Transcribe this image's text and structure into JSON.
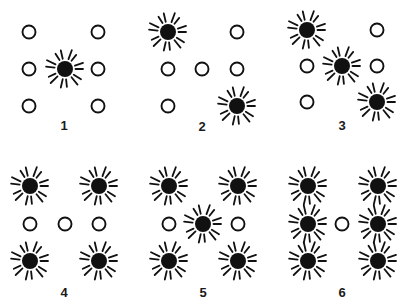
{
  "diagram": {
    "title": "",
    "colors": {
      "ink": "#111111",
      "background": "#ffffff"
    },
    "lamp_positions": [
      "top-left",
      "mid-left",
      "bottom-left",
      "center",
      "top-right",
      "mid-right",
      "bottom-right"
    ],
    "panels": [
      {
        "label": "1",
        "origin": [
          0,
          0
        ],
        "cols": [
          29,
          65,
          98
        ],
        "rows": [
          32,
          69,
          106
        ],
        "label_pos": [
          64,
          125
        ],
        "lit": [
          "center"
        ],
        "unlit": [
          "top-left",
          "mid-left",
          "bottom-left",
          "top-right",
          "mid-right",
          "bottom-right"
        ]
      },
      {
        "label": "2",
        "origin": [
          0,
          0
        ],
        "cols": [
          168,
          202,
          237
        ],
        "rows": [
          32,
          69,
          106
        ],
        "label_pos": [
          202,
          126
        ],
        "lit": [
          "top-left",
          "bottom-right"
        ],
        "unlit": [
          "mid-left",
          "bottom-left",
          "center",
          "top-right",
          "mid-right"
        ]
      },
      {
        "label": "3",
        "origin": [
          0,
          0
        ],
        "cols": [
          307,
          342,
          377
        ],
        "rows": [
          30,
          66,
          102
        ],
        "label_pos": [
          342,
          125
        ],
        "lit": [
          "top-left",
          "center",
          "bottom-right"
        ],
        "unlit": [
          "mid-left",
          "bottom-left",
          "top-right",
          "mid-right"
        ]
      },
      {
        "label": "4",
        "origin": [
          0,
          0
        ],
        "cols": [
          30,
          65,
          99
        ],
        "rows": [
          186,
          224,
          261
        ],
        "label_pos": [
          64,
          292
        ],
        "lit": [
          "top-left",
          "bottom-left",
          "top-right",
          "bottom-right"
        ],
        "unlit": [
          "mid-left",
          "center",
          "mid-right"
        ]
      },
      {
        "label": "5",
        "origin": [
          0,
          0
        ],
        "cols": [
          169,
          203,
          238
        ],
        "rows": [
          186,
          224,
          261
        ],
        "label_pos": [
          203,
          292
        ],
        "lit": [
          "top-left",
          "bottom-left",
          "center",
          "top-right",
          "bottom-right"
        ],
        "unlit": [
          "mid-left",
          "mid-right"
        ]
      },
      {
        "label": "6",
        "origin": [
          0,
          0
        ],
        "cols": [
          308,
          342,
          378
        ],
        "rows": [
          186,
          224,
          261
        ],
        "label_pos": [
          342,
          292
        ],
        "lit": [
          "top-left",
          "mid-left",
          "bottom-left",
          "top-right",
          "mid-right",
          "bottom-right"
        ],
        "unlit": [
          "center"
        ]
      }
    ]
  }
}
